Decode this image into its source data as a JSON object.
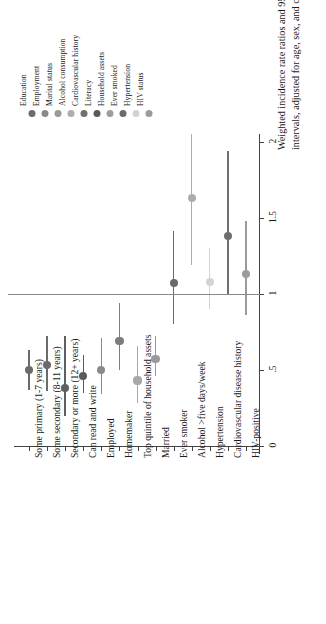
{
  "figure": {
    "axis_title_lines": [
      "Weighted incidence rate ratios and 95% confidence",
      "intervals, adjusted for age, sex, and country of birth"
    ],
    "value_ticks": [
      "0",
      ".5",
      "1",
      "1.5",
      "2"
    ],
    "reference_value": "1"
  },
  "legend": {
    "items": [
      {
        "label": "Education",
        "color": "#6b6b6b"
      },
      {
        "label": "Employment",
        "color": "#8a8a8a"
      },
      {
        "label": "Marital status",
        "color": "#9a9a9a"
      },
      {
        "label": "Alcohol consumption",
        "color": "#adadad"
      },
      {
        "label": "Cardiovascular history",
        "color": "#6f6f6f"
      },
      {
        "label": "Literacy",
        "color": "#5a5a5a"
      },
      {
        "label": "Household assets",
        "color": "#9d9d9d"
      },
      {
        "label": "Ever smoked",
        "color": "#6a6a6a"
      },
      {
        "label": "Hypertension",
        "color": "#d3d3d3"
      },
      {
        "label": "HIV status",
        "color": "#9b9b9b"
      }
    ]
  },
  "chart_data": {
    "type": "scatter",
    "title": "",
    "xlabel": "",
    "ylabel": "Weighted incidence rate ratios and 95% confidence intervals, adjusted for age, sex, and country of birth",
    "ylim": [
      0,
      2.05
    ],
    "yticks": [
      0,
      0.5,
      1,
      1.5,
      2
    ],
    "grid": false,
    "reference_line": 1,
    "orientation": "rotated-90",
    "categories": [
      "Some primary (1-7 years)",
      "Some secondary (8-11 years)",
      "Secondary or more (12+ years)",
      "Can read and write",
      "Employed",
      "Homemaker",
      "Top quintile of household assets",
      "Married",
      "Ever smoker",
      "Alcohol >five days/week",
      "Hypertension",
      "Cardiovascular disease history",
      "HIV-positive"
    ],
    "points": [
      {
        "category": "Some primary (1-7 years)",
        "estimate": 0.5,
        "ci_low": 0.37,
        "ci_high": 0.63,
        "group": "Education",
        "color": "#6b6b6b"
      },
      {
        "category": "Some secondary (8-11 years)",
        "estimate": 0.53,
        "ci_low": 0.36,
        "ci_high": 0.72,
        "group": "Education",
        "color": "#6b6b6b"
      },
      {
        "category": "Secondary or more (12+ years)",
        "estimate": 0.38,
        "ci_low": 0.2,
        "ci_high": 0.72,
        "group": "Education",
        "color": "#5f5f5f"
      },
      {
        "category": "Can read and write",
        "estimate": 0.46,
        "ci_low": 0.35,
        "ci_high": 0.6,
        "group": "Literacy",
        "color": "#5a5a5a"
      },
      {
        "category": "Employed",
        "estimate": 0.5,
        "ci_low": 0.34,
        "ci_high": 0.71,
        "group": "Employment",
        "color": "#8a8a8a"
      },
      {
        "category": "Homemaker",
        "estimate": 0.69,
        "ci_low": 0.5,
        "ci_high": 0.94,
        "group": "Employment",
        "color": "#7d7d7d"
      },
      {
        "category": "Top quintile of household assets",
        "estimate": 0.43,
        "ci_low": 0.28,
        "ci_high": 0.66,
        "group": "Household assets",
        "color": "#a8a8a8"
      },
      {
        "category": "Married",
        "estimate": 0.57,
        "ci_low": 0.46,
        "ci_high": 0.72,
        "group": "Marital status",
        "color": "#9a9a9a"
      },
      {
        "category": "Ever smoker",
        "estimate": 1.07,
        "ci_low": 0.8,
        "ci_high": 1.41,
        "group": "Ever smoked",
        "color": "#6a6a6a"
      },
      {
        "category": "Alcohol >five days/week",
        "estimate": 1.63,
        "ci_low": 1.19,
        "ci_high": 2.05,
        "group": "Alcohol consumption",
        "color": "#adadad"
      },
      {
        "category": "Hypertension",
        "estimate": 1.08,
        "ci_low": 0.9,
        "ci_high": 1.3,
        "group": "Hypertension",
        "color": "#d3d3d3"
      },
      {
        "category": "Cardiovascular disease history",
        "estimate": 1.38,
        "ci_low": 1.0,
        "ci_high": 1.94,
        "group": "Cardiovascular history",
        "color": "#6f6f6f"
      },
      {
        "category": "HIV-positive",
        "estimate": 1.13,
        "ci_low": 0.86,
        "ci_high": 1.48,
        "group": "HIV status",
        "color": "#9b9b9b"
      }
    ]
  }
}
